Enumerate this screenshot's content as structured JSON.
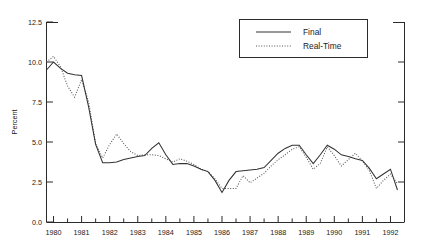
{
  "chart_data": {
    "type": "line",
    "title": "",
    "xlabel": "",
    "ylabel": "Percent",
    "ylim": [
      0.0,
      12.5
    ],
    "xlim": [
      1979.75,
      1992.5
    ],
    "grid": false,
    "legend_position": "top-right",
    "ytick_labels": [
      "0.0",
      "2.5",
      "5.0",
      "7.5",
      "10.0",
      "12.5"
    ],
    "ytick_values": [
      0.0,
      2.5,
      5.0,
      7.5,
      10.0,
      12.5
    ],
    "xtick_labels": [
      "1980",
      "1981",
      "1982",
      "1983",
      "1984",
      "1985",
      "1986",
      "1987",
      "1988",
      "1989",
      "1990",
      "1991",
      "1992"
    ],
    "xtick_values": [
      1980,
      1981,
      1982,
      1983,
      1984,
      1985,
      1986,
      1987,
      1988,
      1989,
      1990,
      1991,
      1992
    ],
    "x": [
      1979.75,
      1980.0,
      1980.25,
      1980.5,
      1980.75,
      1981.0,
      1981.25,
      1981.5,
      1981.75,
      1982.0,
      1982.25,
      1982.5,
      1982.75,
      1983.0,
      1983.25,
      1983.5,
      1983.75,
      1984.0,
      1984.25,
      1984.5,
      1984.75,
      1985.0,
      1985.25,
      1985.5,
      1985.75,
      1986.0,
      1986.25,
      1986.5,
      1986.75,
      1987.0,
      1987.25,
      1987.5,
      1987.75,
      1988.0,
      1988.25,
      1988.5,
      1988.75,
      1989.0,
      1989.25,
      1989.5,
      1989.75,
      1990.0,
      1990.25,
      1990.5,
      1990.75,
      1991.0,
      1991.25,
      1991.5,
      1991.75,
      1992.0,
      1992.25
    ],
    "series": [
      {
        "name": "Final",
        "style": "solid",
        "color": "#333333",
        "values": [
          9.5,
          10.0,
          9.6,
          9.3,
          9.2,
          9.15,
          7.2,
          4.85,
          3.7,
          3.7,
          3.75,
          3.9,
          4.0,
          4.1,
          4.15,
          4.6,
          4.95,
          4.2,
          3.6,
          3.65,
          3.65,
          3.5,
          3.3,
          3.15,
          2.6,
          1.85,
          2.6,
          3.15,
          3.2,
          3.25,
          3.3,
          3.4,
          3.85,
          4.3,
          4.6,
          4.8,
          4.8,
          4.2,
          3.65,
          4.2,
          4.8,
          4.55,
          4.2,
          4.1,
          3.95,
          3.85,
          3.35,
          2.7,
          3.0,
          3.3,
          2.0
        ]
      },
      {
        "name": "Real-Time",
        "style": "dotted",
        "color": "#555555",
        "values": [
          10.0,
          10.35,
          9.7,
          8.5,
          7.8,
          8.9,
          7.5,
          4.9,
          4.0,
          4.85,
          5.5,
          4.9,
          4.4,
          4.15,
          4.2,
          4.2,
          4.15,
          3.95,
          3.75,
          3.95,
          3.8,
          3.6,
          3.3,
          3.15,
          2.7,
          2.1,
          2.1,
          2.1,
          2.9,
          2.45,
          2.75,
          3.05,
          3.5,
          3.9,
          4.2,
          4.55,
          4.7,
          4.05,
          3.3,
          3.65,
          4.7,
          4.15,
          3.5,
          3.9,
          4.3,
          3.8,
          3.2,
          2.1,
          2.6,
          3.0,
          2.4
        ]
      }
    ]
  },
  "legend": {
    "entries": [
      {
        "label": "Final",
        "style": "solid"
      },
      {
        "label": "Real-Time",
        "style": "dotted"
      }
    ]
  },
  "colors": {
    "axis": "#2b2b2b",
    "final": "#333333",
    "realtime": "#555555",
    "background": "#ffffff"
  }
}
